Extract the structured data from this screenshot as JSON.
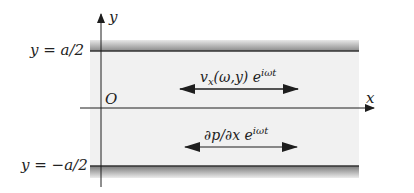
{
  "diagram": {
    "axes": {
      "x_label": "x",
      "y_label": "y",
      "origin_label": "O"
    },
    "walls": {
      "upper_label": "y = a/2",
      "lower_label": "y = −a/2"
    },
    "annotations": {
      "velocity": {
        "main": "v",
        "sub": "x",
        "args": "(ω,y) e",
        "sup": "iωt"
      },
      "pressure_gradient": {
        "main": "∂p/∂x e",
        "sup": "iωt"
      }
    },
    "colors": {
      "fluid_fill": "#f1f1f1",
      "wall_dark": "#6e6e6e",
      "wall_light": "#e6e6e6",
      "line": "#1e1e1e"
    }
  }
}
